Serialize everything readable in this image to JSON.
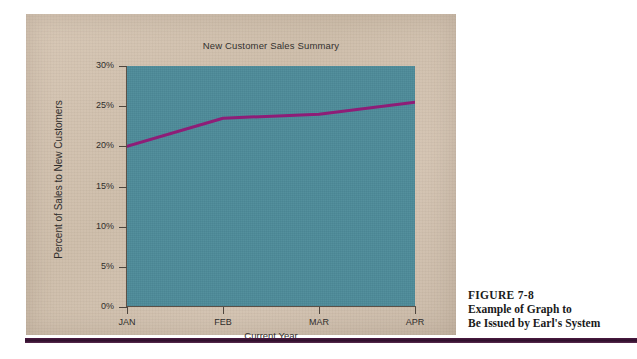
{
  "figure": {
    "number": "FIGURE 7-8",
    "caption_lines": [
      "Example of Graph to",
      "Be Issued by Earl's System"
    ]
  },
  "colors": {
    "panel_background": "#d0c0ad",
    "plot_background": "#4d8b99",
    "series_line": "#8e1d77",
    "axis": "#5a5148",
    "rule": "#2e0f2a",
    "text": "#2f2d2b"
  },
  "chart_data": {
    "type": "line",
    "title": "New Customer Sales Summary",
    "xlabel": "Current Year",
    "ylabel": "Percent of Sales to New Customers",
    "categories": [
      "JAN",
      "FEB",
      "MAR",
      "APR"
    ],
    "values": [
      20,
      23.5,
      24,
      25.5
    ],
    "series": [
      {
        "name": "Percent of Sales to New Customers",
        "values": [
          20,
          23.5,
          24,
          25.5
        ]
      }
    ],
    "ylim": [
      0,
      30
    ],
    "ytick_values": [
      0,
      5,
      10,
      15,
      20,
      25,
      30
    ],
    "ytick_labels": [
      "0%",
      "5%",
      "10%",
      "15%",
      "20%",
      "25%",
      "30%"
    ],
    "grid": false,
    "legend": false,
    "legend_position": "none"
  }
}
